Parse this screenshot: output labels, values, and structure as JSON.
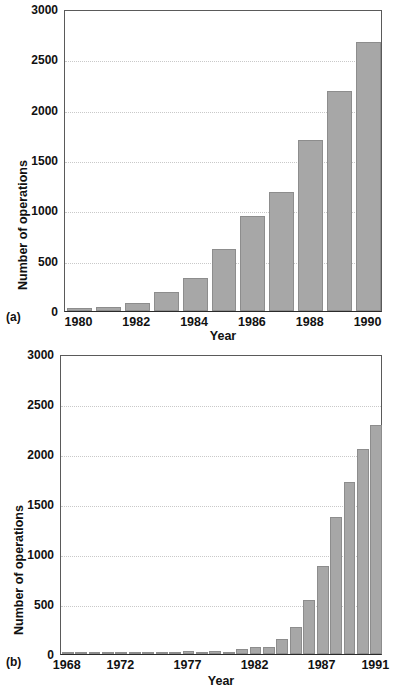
{
  "figure": {
    "panels": [
      {
        "tag": "(a)",
        "chart_data": {
          "type": "bar",
          "title": "",
          "xlabel": "Year",
          "ylabel": "Number of operations",
          "ylim": [
            0,
            3000
          ],
          "yticks": [
            0,
            500,
            1000,
            1500,
            2000,
            2500,
            3000
          ],
          "ytick_labels": [
            "0",
            "500",
            "1000",
            "1500",
            "2000",
            "2500",
            "3000"
          ],
          "grid": true,
          "legend": "none",
          "categories": [
            "1980",
            "1981",
            "1982",
            "1983",
            "1984",
            "1985",
            "1986",
            "1987",
            "1988",
            "1989",
            "1990"
          ],
          "xtick_labels": [
            "1980",
            "1982",
            "1984",
            "1986",
            "1988",
            "1990"
          ],
          "xtick_categories": [
            "1980",
            "1982",
            "1984",
            "1986",
            "1988",
            "1990"
          ],
          "values": [
            30,
            35,
            75,
            190,
            325,
            620,
            945,
            1180,
            1700,
            2190,
            2670
          ]
        }
      },
      {
        "tag": "(b)",
        "chart_data": {
          "type": "bar",
          "title": "",
          "xlabel": "Year",
          "ylabel": "Number of operations",
          "ylim": [
            0,
            3000
          ],
          "yticks": [
            0,
            500,
            1000,
            1500,
            2000,
            2500,
            3000
          ],
          "ytick_labels": [
            "0",
            "500",
            "1000",
            "1500",
            "2000",
            "2500",
            "3000"
          ],
          "grid": true,
          "legend": "none",
          "categories": [
            "1968",
            "1969",
            "1970",
            "1971",
            "1972",
            "1973",
            "1974",
            "1975",
            "1976",
            "1977",
            "1978",
            "1979",
            "1980",
            "1981",
            "1982",
            "1983",
            "1984",
            "1985",
            "1986",
            "1987",
            "1988",
            "1989",
            "1990",
            "1991"
          ],
          "xtick_labels": [
            "1968",
            "1972",
            "1977",
            "1982",
            "1987",
            "1991"
          ],
          "xtick_categories": [
            "1968",
            "1972",
            "1977",
            "1982",
            "1987",
            "1991"
          ],
          "values": [
            5,
            5,
            5,
            5,
            6,
            8,
            10,
            20,
            22,
            28,
            15,
            28,
            25,
            50,
            75,
            70,
            155,
            275,
            545,
            880,
            1370,
            1720,
            2050,
            2290
          ]
        }
      }
    ]
  }
}
